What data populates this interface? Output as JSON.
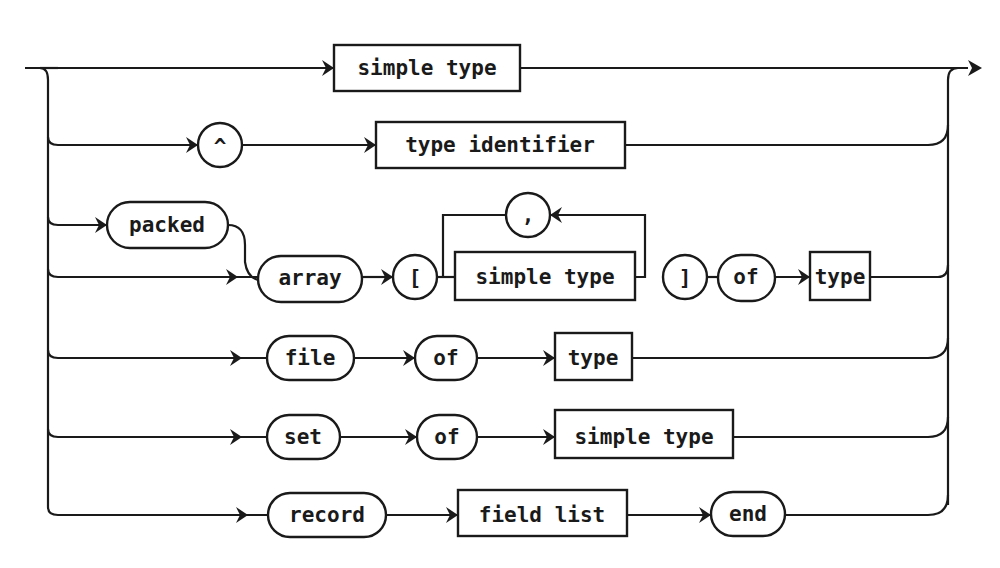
{
  "figure": {
    "corner_mark": "\"",
    "colors": {
      "ink": "#1a1a1a",
      "background": "#ffffff"
    }
  },
  "rows": [
    {
      "id": "simple",
      "items": [
        {
          "kind": "box",
          "label": "simple type"
        }
      ]
    },
    {
      "id": "pointer",
      "items": [
        {
          "kind": "circle",
          "label": "^"
        },
        {
          "kind": "box",
          "label": "type identifier"
        }
      ]
    },
    {
      "id": "packed",
      "items": [
        {
          "kind": "pill",
          "label": "packed"
        }
      ]
    },
    {
      "id": "array",
      "items": [
        {
          "kind": "pill",
          "label": "array"
        },
        {
          "kind": "circle",
          "label": "["
        },
        {
          "kind": "box",
          "label": "simple type"
        },
        {
          "kind": "circle",
          "label": ","
        },
        {
          "kind": "circle",
          "label": "]"
        },
        {
          "kind": "pill",
          "label": "of"
        },
        {
          "kind": "box",
          "label": "type"
        }
      ]
    },
    {
      "id": "file",
      "items": [
        {
          "kind": "pill",
          "label": "file"
        },
        {
          "kind": "pill",
          "label": "of"
        },
        {
          "kind": "box",
          "label": "type"
        }
      ]
    },
    {
      "id": "set",
      "items": [
        {
          "kind": "pill",
          "label": "set"
        },
        {
          "kind": "pill",
          "label": "of"
        },
        {
          "kind": "box",
          "label": "simple type"
        }
      ]
    },
    {
      "id": "record",
      "items": [
        {
          "kind": "pill",
          "label": "record"
        },
        {
          "kind": "box",
          "label": "field list"
        },
        {
          "kind": "pill",
          "label": "end"
        }
      ]
    }
  ]
}
